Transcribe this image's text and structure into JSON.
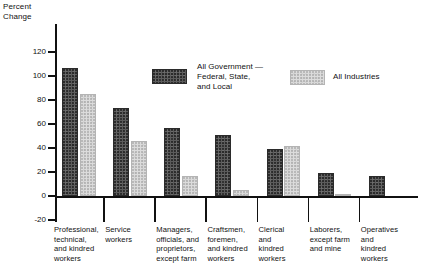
{
  "chart_data": {
    "type": "bar",
    "title": "",
    "subtitle": "",
    "ylabel": "Percent\nChange",
    "xlabel": "",
    "ylim": [
      -20,
      120
    ],
    "yticks": [
      -20,
      0,
      20,
      40,
      60,
      80,
      100,
      120
    ],
    "ytick_labels": [
      "-20",
      "0",
      "20",
      "40",
      "60",
      "80",
      "100",
      "120"
    ],
    "grid": false,
    "legend_position": "upper-center",
    "categories": [
      "Professional,\ntechnical,\nand kindred\nworkers",
      "Service\nworkers",
      "Managers,\nofficials, and\nproprietors,\nexcept farm",
      "Craftsmen,\nforemen,\nand kindred\nworkers",
      "Clerical\nand\nkindred\nworkers",
      "Laborers,\nexcept farm\nand mine",
      "Operatives\nand\nkindred\nworkers"
    ],
    "series": [
      {
        "name": "All Government —\nFederal, State,\nand Local",
        "color": "#5c5c5c",
        "values": [
          107,
          73,
          57,
          51,
          39,
          19,
          17
        ]
      },
      {
        "name": "All Industries",
        "color": "#dcdcdc",
        "values": [
          85,
          46,
          17,
          5,
          42,
          2,
          0
        ]
      }
    ]
  },
  "legend": {
    "entries": [
      {
        "label": "All Government —\nFederal, State,\nand Local",
        "swatch": "dark-swatch"
      },
      {
        "label": "All Industries",
        "swatch": "light-swatch"
      }
    ]
  },
  "axis": {
    "y_title": "Percent\nChange"
  }
}
